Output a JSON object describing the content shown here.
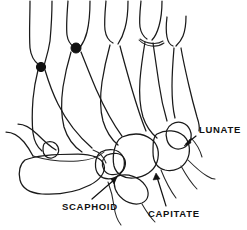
{
  "figure": {
    "background_color": "#ffffff",
    "line_color": "#1a1a1a",
    "width": 247,
    "height": 230
  },
  "labels": [
    {
      "id": "lunate",
      "text": "LUNATE",
      "text_x": 199,
      "text_y": 133,
      "leader": {
        "x1": 196,
        "y1": 136,
        "x2": 185,
        "y2": 145
      },
      "arrow_tip": {
        "x": 184,
        "y": 146
      },
      "arrow_angle": 222
    },
    {
      "id": "scaphoid",
      "text": "SCAPHOID",
      "text_x": 62,
      "text_y": 210,
      "leader": {
        "x1": 92,
        "y1": 199,
        "x2": 115,
        "y2": 179
      },
      "arrow_tip": {
        "x": 117,
        "y": 177
      },
      "arrow_angle": 319
    },
    {
      "id": "capitate",
      "text": "CAPITATE",
      "text_x": 148,
      "text_y": 217,
      "leader": {
        "x1": 166,
        "y1": 206,
        "x2": 157,
        "y2": 176
      },
      "arrow_tip": {
        "x": 156,
        "y": 173
      },
      "arrow_angle": 252
    }
  ],
  "markers": [
    {
      "id": "marker-1",
      "cx": 41,
      "cy": 67,
      "r": 4.6
    },
    {
      "id": "marker-2",
      "cx": 76,
      "cy": 48,
      "r": 5.0
    }
  ],
  "colors": {
    "stroke": "#1a1a1a",
    "marker": "#111111",
    "label": "#111111",
    "background": "#ffffff"
  }
}
